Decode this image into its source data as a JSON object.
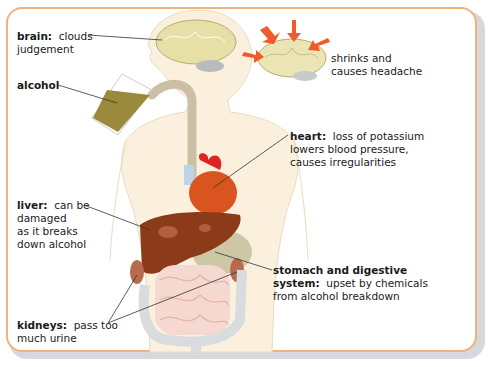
{
  "diagram": {
    "labels": [
      {
        "id": "brain",
        "term": "brain:",
        "lines": [
          "clouds",
          "judgement"
        ]
      },
      {
        "id": "alcohol",
        "term": "alcohol",
        "lines": []
      },
      {
        "id": "shrink",
        "term": "",
        "lines": [
          "shrinks and",
          "causes headache"
        ]
      },
      {
        "id": "heart",
        "term": "heart:",
        "lines": [
          "loss of potassium",
          "lowers blood pressure,",
          "causes irregularities"
        ]
      },
      {
        "id": "liver",
        "term": "liver:",
        "lines": [
          "can be",
          "damaged",
          "as it breaks",
          "down alcohol"
        ]
      },
      {
        "id": "stomach",
        "term": "stomach and digestive",
        "term2": "system:",
        "lines": [
          "upset by chemicals",
          "from alcohol breakdown"
        ]
      },
      {
        "id": "kidneys",
        "term": "kidneys:",
        "lines": [
          "pass too",
          "much urine"
        ]
      }
    ],
    "colors": {
      "border": "#f0b27a",
      "skin": "#fbf0dd",
      "brain": "#e6dfa6",
      "liver": "#8b3a1a",
      "heart": "#d9541f",
      "alcohol": "#9c8a3c",
      "arrow": "#f05a28"
    }
  }
}
